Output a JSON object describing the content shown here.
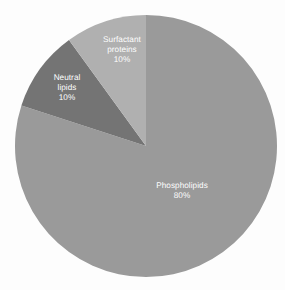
{
  "chart_data": {
    "type": "pie",
    "title": "",
    "subtitle": "",
    "xlabel": "",
    "ylabel": "",
    "legend_position": "none",
    "grid": false,
    "unit": "%",
    "start_angle_deg": 0,
    "direction": "clockwise",
    "background_color": "#fdfdfd",
    "label_color": "#ffffff",
    "categories": [
      "Phospholipids",
      "Neutral lipids",
      "Surfactant proteins"
    ],
    "values": [
      80,
      10,
      10
    ],
    "slices": [
      {
        "label": "Phospholipids",
        "label_line1": "Phospholipids",
        "label_line2": "",
        "value": 80,
        "value_text": "80%",
        "color": "#9a9a9a",
        "start_deg": 0,
        "end_deg": 288,
        "label_x": 182,
        "label_y": 191
      },
      {
        "label": "Neutral lipids",
        "label_line1": "Neutral",
        "label_line2": "lipids",
        "value": 10,
        "value_text": "10%",
        "color": "#747474",
        "start_deg": 288,
        "end_deg": 324,
        "label_x": 67,
        "label_y": 88
      },
      {
        "label": "Surfactant proteins",
        "label_line1": "Surfactant",
        "label_line2": "proteins",
        "value": 10,
        "value_text": "10%",
        "color": "#b0b0b0",
        "start_deg": 324,
        "end_deg": 360,
        "label_x": 122,
        "label_y": 50
      }
    ],
    "geometry": {
      "center_x": 146,
      "center_y": 146,
      "radius": 131
    }
  }
}
